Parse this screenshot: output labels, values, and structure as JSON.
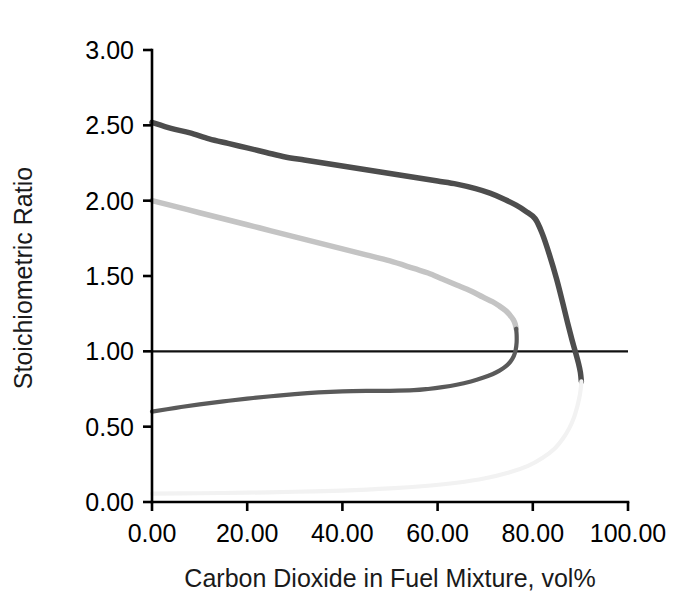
{
  "chart_data": {
    "type": "line",
    "title": "",
    "xlabel": "Carbon Dioxide in Fuel Mixture, vol%",
    "ylabel": "Stoichiometric Ratio",
    "xlim": [
      0,
      100
    ],
    "ylim": [
      0,
      3
    ],
    "xticks": [
      0,
      20,
      40,
      60,
      80,
      100
    ],
    "yticks": [
      0,
      0.5,
      1,
      1.5,
      2,
      2.5,
      3
    ],
    "xticklabels": [
      "0.00",
      "20.00",
      "40.00",
      "60.00",
      "80.00",
      "100.00"
    ],
    "yticklabels": [
      "0.00",
      "0.50",
      "1.00",
      "1.50",
      "2.00",
      "2.50",
      "3.00"
    ],
    "grid": false,
    "legend": "none",
    "annotations": [
      {
        "name": "stoichiometric-reference-line",
        "type": "hline",
        "y": 1.0,
        "label": "",
        "color": "#111111"
      }
    ],
    "series": [
      {
        "name": "upper-flammability-limit-curve",
        "color": "#4d4d4d",
        "width": 5.5,
        "points": [
          [
            0.0,
            2.52
          ],
          [
            4.0,
            2.48
          ],
          [
            8.0,
            2.45
          ],
          [
            12.0,
            2.41
          ],
          [
            16.0,
            2.38
          ],
          [
            20.0,
            2.35
          ],
          [
            24.0,
            2.32
          ],
          [
            28.0,
            2.29
          ],
          [
            32.0,
            2.27
          ],
          [
            36.0,
            2.25
          ],
          [
            40.0,
            2.23
          ],
          [
            44.0,
            2.21
          ],
          [
            48.0,
            2.19
          ],
          [
            52.0,
            2.17
          ],
          [
            56.0,
            2.15
          ],
          [
            60.0,
            2.13
          ],
          [
            64.0,
            2.11
          ],
          [
            68.0,
            2.08
          ],
          [
            71.0,
            2.05
          ],
          [
            74.0,
            2.01
          ],
          [
            76.5,
            1.97
          ],
          [
            78.5,
            1.93
          ],
          [
            80.5,
            1.88
          ],
          [
            82.0,
            1.78
          ],
          [
            83.5,
            1.64
          ],
          [
            85.0,
            1.48
          ],
          [
            86.3,
            1.32
          ],
          [
            87.3,
            1.19
          ],
          [
            88.2,
            1.08
          ],
          [
            89.0,
            0.99
          ],
          [
            89.6,
            0.92
          ],
          [
            90.0,
            0.86
          ],
          [
            90.2,
            0.8
          ]
        ]
      },
      {
        "name": "mid-gray-limit-curve",
        "color": "#c4c4c4",
        "width": 5.5,
        "points": [
          [
            0.0,
            2.0
          ],
          [
            5.0,
            1.96
          ],
          [
            10.0,
            1.92
          ],
          [
            15.0,
            1.88
          ],
          [
            20.0,
            1.84
          ],
          [
            25.0,
            1.8
          ],
          [
            30.0,
            1.76
          ],
          [
            35.0,
            1.72
          ],
          [
            40.0,
            1.68
          ],
          [
            45.0,
            1.64
          ],
          [
            50.0,
            1.6
          ],
          [
            55.0,
            1.55
          ],
          [
            58.0,
            1.52
          ],
          [
            61.0,
            1.48
          ],
          [
            64.0,
            1.44
          ],
          [
            67.0,
            1.4
          ],
          [
            69.5,
            1.36
          ],
          [
            71.5,
            1.33
          ],
          [
            73.0,
            1.3
          ],
          [
            74.3,
            1.27
          ],
          [
            75.2,
            1.24
          ],
          [
            75.9,
            1.21
          ],
          [
            76.3,
            1.18
          ],
          [
            76.5,
            1.15
          ]
        ]
      },
      {
        "name": "lower-branch-dark-curve",
        "color": "#5a5a5a",
        "width": 4.2,
        "points": [
          [
            0.0,
            0.6
          ],
          [
            5.0,
            0.625
          ],
          [
            10.0,
            0.648
          ],
          [
            15.0,
            0.668
          ],
          [
            20.0,
            0.686
          ],
          [
            25.0,
            0.702
          ],
          [
            30.0,
            0.716
          ],
          [
            35.0,
            0.727
          ],
          [
            40.0,
            0.734
          ],
          [
            45.0,
            0.737
          ],
          [
            50.0,
            0.738
          ],
          [
            55.0,
            0.742
          ],
          [
            58.0,
            0.75
          ],
          [
            61.0,
            0.762
          ],
          [
            64.0,
            0.778
          ],
          [
            67.0,
            0.8
          ],
          [
            69.5,
            0.824
          ],
          [
            71.5,
            0.848
          ],
          [
            73.0,
            0.872
          ],
          [
            74.3,
            0.9
          ],
          [
            75.3,
            0.932
          ],
          [
            76.0,
            0.968
          ],
          [
            76.4,
            1.01
          ],
          [
            76.6,
            1.06
          ],
          [
            76.6,
            1.11
          ],
          [
            76.5,
            1.15
          ]
        ]
      },
      {
        "name": "faint-lower-limit-curve",
        "color": "#f2f2f2",
        "width": 4.2,
        "points": [
          [
            0.0,
            0.055
          ],
          [
            10.0,
            0.058
          ],
          [
            20.0,
            0.062
          ],
          [
            30.0,
            0.068
          ],
          [
            40.0,
            0.076
          ],
          [
            50.0,
            0.09
          ],
          [
            58.0,
            0.108
          ],
          [
            64.0,
            0.128
          ],
          [
            70.0,
            0.158
          ],
          [
            75.0,
            0.196
          ],
          [
            79.0,
            0.24
          ],
          [
            82.0,
            0.292
          ],
          [
            84.5,
            0.352
          ],
          [
            86.3,
            0.42
          ],
          [
            87.7,
            0.492
          ],
          [
            88.7,
            0.565
          ],
          [
            89.4,
            0.64
          ],
          [
            89.9,
            0.712
          ],
          [
            90.15,
            0.775
          ],
          [
            90.2,
            0.8
          ]
        ]
      }
    ]
  },
  "axes": {
    "x_axis_name": "x-axis",
    "y_axis_name": "y-axis"
  }
}
